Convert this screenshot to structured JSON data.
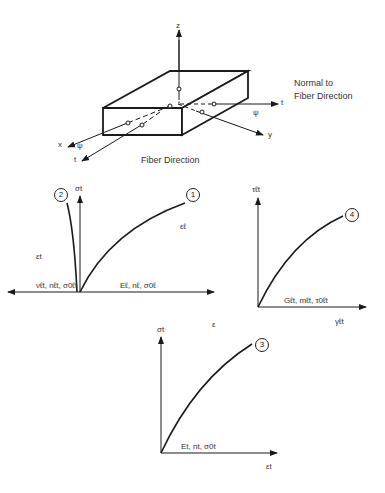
{
  "diagram": {
    "block": {
      "axes": {
        "z": "z",
        "t_right": "t",
        "y": "y",
        "x": "x",
        "t_left": "t",
        "psi_right": "ψ",
        "psi_left": "ψ"
      },
      "labels": {
        "normal_line1": "Normal to",
        "normal_line2": "Fiber Direction",
        "fiber_direction": "Fiber Direction"
      }
    },
    "plot_12": {
      "y_axis_label": "σt",
      "x_axis_label": "ε",
      "curve1_marker": "1",
      "curve1_label": "εℓ",
      "curve2_marker": "2",
      "curve2_label": "εt",
      "left_params": "νℓt, nℓt, σ0ℓt",
      "right_params": "Eℓ, nℓ, σ0ℓ"
    },
    "plot_4": {
      "y_axis_label": "τℓt",
      "x_axis_label": "γℓt",
      "curve_marker": "4",
      "params": "Gℓt, mℓt, τ0ℓt"
    },
    "plot_3": {
      "y_axis_label": "σt",
      "x_axis_label": "εt",
      "curve_marker": "3",
      "params": "Et, nt, σ0t"
    },
    "colors": {
      "line": "#1a1a1a",
      "text": "#333333",
      "background": "#ffffff"
    }
  }
}
